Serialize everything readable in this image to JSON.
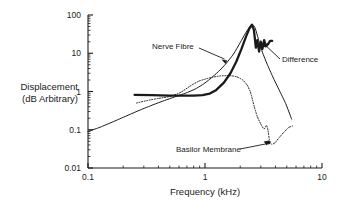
{
  "chart_data": {
    "type": "line",
    "title": "",
    "xlabel": "Frequency (kHz)",
    "ylabel_line1": "Displacement",
    "ylabel_line2": "(dB Arbitrary)",
    "xscale": "log",
    "yscale": "log",
    "xlim": [
      0.1,
      10
    ],
    "ylim": [
      0.01,
      100
    ],
    "grid": false,
    "legend_position": "inline-annotations",
    "xticks": [
      "0.1",
      "1",
      "10"
    ],
    "xtick_values": [
      0.1,
      1,
      10
    ],
    "yticks": [
      "0.01",
      "0.1",
      "1",
      "10",
      "100"
    ],
    "ytick_values": [
      0.01,
      0.1,
      1,
      10,
      100
    ],
    "series": [
      {
        "name": "Nerve Fibre",
        "style": "thin-solid",
        "color": "#1a1a1a",
        "x": [
          0.1,
          0.13,
          0.17,
          0.22,
          0.28,
          0.36,
          0.45,
          0.55,
          0.68,
          0.82,
          0.95,
          1.1,
          1.3,
          1.5,
          1.75,
          2.0,
          2.2,
          2.4,
          2.55,
          2.65,
          2.75,
          2.9,
          3.1,
          3.4,
          3.8,
          4.3,
          4.9,
          5.5
        ],
        "y": [
          0.09,
          0.12,
          0.17,
          0.24,
          0.33,
          0.45,
          0.58,
          0.72,
          0.9,
          1.15,
          1.5,
          2.1,
          3.3,
          5.2,
          9.5,
          19.0,
          32.0,
          48.0,
          55.0,
          50.0,
          36.0,
          20.0,
          10.5,
          5.2,
          2.4,
          1.1,
          0.48,
          0.19
        ]
      },
      {
        "name": "Basilor Membrane",
        "style": "dotted",
        "color": "#1a1a1a",
        "x": [
          0.26,
          0.32,
          0.4,
          0.5,
          0.62,
          0.75,
          0.88,
          1.0,
          1.15,
          1.35,
          1.6,
          1.85,
          2.1,
          2.3,
          2.45,
          2.55,
          2.65,
          2.8,
          3.0,
          3.2,
          3.35,
          3.45,
          3.55,
          3.7,
          3.95,
          4.3,
          4.7,
          5.2,
          5.6
        ],
        "y": [
          0.5,
          0.58,
          0.66,
          0.74,
          0.95,
          1.4,
          1.85,
          2.1,
          2.35,
          2.55,
          2.6,
          2.45,
          2.0,
          1.45,
          0.95,
          0.6,
          0.38,
          0.22,
          0.14,
          0.105,
          0.13,
          0.1,
          0.055,
          0.042,
          0.045,
          0.062,
          0.085,
          0.115,
          0.125
        ]
      },
      {
        "name": "Difference",
        "style": "thick-solid",
        "color": "#1a1a1a",
        "x": [
          0.25,
          0.35,
          0.5,
          0.65,
          0.8,
          0.95,
          1.1,
          1.25,
          1.45,
          1.65,
          1.85,
          2.05,
          2.25,
          2.4,
          2.52,
          2.62,
          2.72,
          2.8,
          2.9,
          3.0,
          3.1,
          3.2,
          3.3,
          3.45,
          3.6,
          3.75
        ],
        "y": [
          0.82,
          0.8,
          0.78,
          0.78,
          0.78,
          0.8,
          0.88,
          1.1,
          1.7,
          3.0,
          6.0,
          13.0,
          28.0,
          45.0,
          56.0,
          40.0,
          14.0,
          22.0,
          11.0,
          20.0,
          13.0,
          22.0,
          16.0,
          17.0,
          21.0,
          21.0
        ]
      }
    ],
    "annotations": [
      {
        "text": "Nerve Fibre",
        "target_series": "Nerve Fibre",
        "label_x": 0.4,
        "label_y": 13.0
      },
      {
        "text": "Difference",
        "target_series": "Difference",
        "label_x": 4.2,
        "label_y": 6.0
      },
      {
        "text": "Basilor Membrane",
        "target_series": "Basilor Membrane",
        "label_x": 0.9,
        "label_y": 0.03
      }
    ]
  }
}
